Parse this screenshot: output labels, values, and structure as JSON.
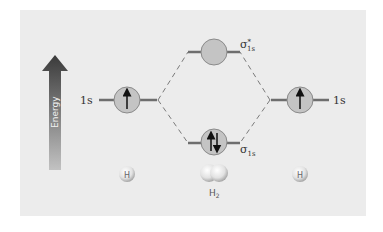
{
  "diagram": {
    "type": "molecular-orbital-diagram",
    "energy_axis": {
      "label": "Energy",
      "direction": "up"
    },
    "left_atom": {
      "orbital_label": "1s",
      "electrons": "up",
      "atom_label": "H"
    },
    "right_atom": {
      "orbital_label": "1s",
      "electrons": "up",
      "atom_label": "H"
    },
    "antibonding": {
      "label_main": "σ",
      "label_sup": "*",
      "label_sub": "1s",
      "electrons": "none"
    },
    "bonding": {
      "label_main": "σ",
      "label_sub": "1s",
      "electrons": "up-down"
    },
    "molecule": {
      "label_main": "H",
      "label_sub": "2"
    },
    "colors": {
      "panel": "#ececec",
      "level_line": "#6e6e6e",
      "orbital_fill": "#c4c4c4",
      "orbital_stroke": "#8a8a8a",
      "arrow_top": "#3a3a3a",
      "arrow_bottom": "#bdbdbd",
      "dash": "#777777"
    }
  }
}
